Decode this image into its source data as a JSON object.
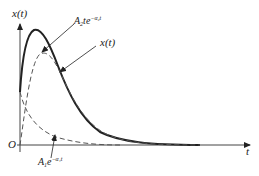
{
  "diagram": {
    "y_axis_label": "x(t)",
    "x_axis_label": "t",
    "origin_label": "O",
    "curves": [
      {
        "name": "x(t)",
        "style": "solid",
        "label_main": "x(t)"
      },
      {
        "name": "A2 t e^{-a2 t}",
        "style": "dashed",
        "label_coef": "A",
        "label_coef_sub": "2",
        "label_body": "te",
        "label_exp": "−α₂t"
      },
      {
        "name": "A1 e^{-a1 t}",
        "style": "dashed",
        "label_coef": "A",
        "label_coef_sub": "1",
        "label_body": "e",
        "label_exp": "−α₁t"
      }
    ],
    "colors": {
      "ink": "#222222",
      "dashed": "#555555",
      "axis": "#444444"
    }
  }
}
